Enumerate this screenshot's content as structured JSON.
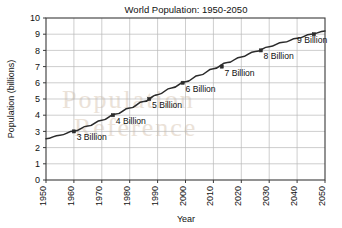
{
  "chart_data": {
    "type": "line",
    "title": "World Population: 1950-2050",
    "xlabel": "Year",
    "ylabel": "Population (billions)",
    "xlim": [
      1950,
      2050
    ],
    "ylim": [
      0,
      10
    ],
    "grid": true,
    "legend": "none",
    "x_ticks": [
      "1950",
      "1960",
      "1970",
      "1980",
      "1990",
      "2000",
      "2010",
      "2020",
      "2030",
      "2040",
      "2050"
    ],
    "y_ticks": [
      "0",
      "1",
      "2",
      "3",
      "4",
      "5",
      "6",
      "7",
      "8",
      "9",
      "10"
    ],
    "x": [
      1950,
      1955,
      1960,
      1965,
      1970,
      1975,
      1980,
      1985,
      1990,
      1995,
      2000,
      2005,
      2010,
      2015,
      2020,
      2025,
      2030,
      2035,
      2040,
      2045,
      2050
    ],
    "values": [
      2.55,
      2.77,
      3.02,
      3.33,
      3.69,
      4.07,
      4.44,
      4.84,
      5.27,
      5.68,
      6.07,
      6.47,
      6.87,
      7.25,
      7.6,
      7.93,
      8.23,
      8.5,
      8.75,
      8.99,
      9.2
    ],
    "series": [
      {
        "name": "World population",
        "values": [
          2.55,
          2.77,
          3.02,
          3.33,
          3.69,
          4.07,
          4.44,
          4.84,
          5.27,
          5.68,
          6.07,
          6.47,
          6.87,
          7.25,
          7.6,
          7.93,
          8.23,
          8.5,
          8.75,
          8.99,
          9.2
        ]
      }
    ],
    "annotations": [
      {
        "label": "3 Billion",
        "year": 1960,
        "value": 3,
        "label_x": 1961,
        "label_y": 2.45
      },
      {
        "label": "4 Billion",
        "year": 1974,
        "value": 4,
        "label_x": 1975,
        "label_y": 3.45
      },
      {
        "label": "5 Billion",
        "year": 1987,
        "value": 5,
        "label_x": 1988,
        "label_y": 4.45
      },
      {
        "label": "6 Billion",
        "year": 1999,
        "value": 6,
        "label_x": 2000,
        "label_y": 5.45
      },
      {
        "label": "7 Billion",
        "year": 2013,
        "value": 7,
        "label_x": 2014,
        "label_y": 6.45
      },
      {
        "label": "8 Billion",
        "year": 2027,
        "value": 8,
        "label_x": 2028,
        "label_y": 7.45
      },
      {
        "label": "9 Billion",
        "year": 2046,
        "value": 9,
        "label_x": 2040,
        "label_y": 8.45
      }
    ],
    "markers": [
      {
        "year": 1960,
        "value": 3
      },
      {
        "year": 1974,
        "value": 4
      },
      {
        "year": 1987,
        "value": 5
      },
      {
        "year": 1999,
        "value": 6
      },
      {
        "year": 2013,
        "value": 7
      },
      {
        "year": 2027,
        "value": 8
      },
      {
        "year": 2046,
        "value": 9
      }
    ],
    "colors": {
      "line": "#2b2b2b",
      "grid": "#b9b9b9",
      "frame": "#3a3a3a",
      "background": "#ffffff",
      "watermark": "#e8ddd2"
    }
  },
  "watermark": {
    "line1": "Population",
    "line2": "Reference"
  }
}
